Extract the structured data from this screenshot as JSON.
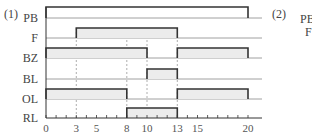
{
  "part1_label": "(1)",
  "part2_label": "(2)",
  "part2_partial_labels": [
    "PB",
    "F"
  ],
  "axis": {
    "min": 0,
    "max": 20,
    "tick_labels": [
      0,
      3,
      5,
      8,
      10,
      13,
      15,
      20
    ],
    "minor_tick_step": 1
  },
  "signals": [
    {
      "name": "PB",
      "high": [
        [
          0,
          20
        ]
      ],
      "filled": false
    },
    {
      "name": "F",
      "high": [
        [
          3,
          13
        ]
      ],
      "filled": true
    },
    {
      "name": "BZ",
      "high": [
        [
          0,
          10
        ],
        [
          13,
          20
        ]
      ],
      "filled": true
    },
    {
      "name": "BL",
      "high": [
        [
          10,
          13
        ]
      ],
      "filled": true
    },
    {
      "name": "OL",
      "high": [
        [
          0,
          8
        ],
        [
          13,
          20
        ]
      ],
      "filled": true
    },
    {
      "name": "RL",
      "high": [
        [
          8,
          13
        ]
      ],
      "filled": true
    }
  ],
  "dashed_guides": [
    3,
    8,
    10,
    13
  ],
  "colors": {
    "line": "#333333",
    "baseline": "#888888",
    "fill": "#ececec",
    "dash": "#999999"
  }
}
